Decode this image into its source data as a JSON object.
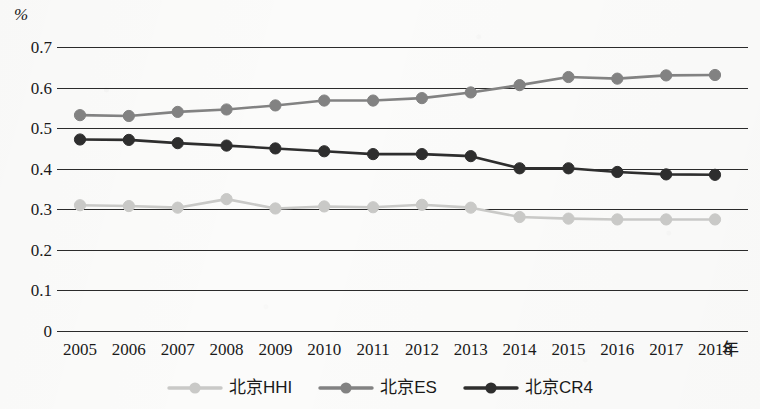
{
  "chart_data": {
    "type": "line",
    "title": "",
    "subtitle": "",
    "xlabel": "年",
    "ylabel": "%",
    "unit_label": "%",
    "x": [
      2005,
      2006,
      2007,
      2008,
      2009,
      2010,
      2011,
      2012,
      2013,
      2014,
      2015,
      2016,
      2017,
      2018
    ],
    "categories": [
      "2005",
      "2006",
      "2007",
      "2008",
      "2009",
      "2010",
      "2011",
      "2012",
      "2013",
      "2014",
      "2015",
      "2016",
      "2017",
      "2018"
    ],
    "ylim": [
      0,
      0.7
    ],
    "yticks": [
      0,
      0.1,
      0.2,
      0.3,
      0.4,
      0.5,
      0.6,
      0.7
    ],
    "ytick_labels": [
      "0",
      "0.1",
      "0.2",
      "0.3",
      "0.4",
      "0.5",
      "0.6",
      "0.7"
    ],
    "grid": true,
    "grid_axis": "y",
    "legend_position": "bottom",
    "marker": "circle",
    "series": [
      {
        "name": "北京HHI",
        "color": "#c9c9c7",
        "values": [
          0.31,
          0.308,
          0.304,
          0.325,
          0.302,
          0.307,
          0.305,
          0.311,
          0.304,
          0.281,
          0.277,
          0.275,
          0.275,
          0.275
        ]
      },
      {
        "name": "北京ES",
        "color": "#828282",
        "values": [
          0.532,
          0.53,
          0.54,
          0.546,
          0.556,
          0.568,
          0.568,
          0.574,
          0.588,
          0.606,
          0.626,
          0.622,
          0.63,
          0.631
        ]
      },
      {
        "name": "北京CR4",
        "color": "#2e2e2e",
        "values": [
          0.472,
          0.471,
          0.463,
          0.457,
          0.45,
          0.443,
          0.436,
          0.436,
          0.431,
          0.401,
          0.401,
          0.392,
          0.386,
          0.385
        ]
      }
    ]
  },
  "axes": {
    "unit_label": "%",
    "x_unit_label": "年"
  },
  "legend": {
    "items": [
      {
        "label": "北京HHI",
        "color": "#c9c9c7"
      },
      {
        "label": "北京ES",
        "color": "#828282"
      },
      {
        "label": "北京CR4",
        "color": "#2e2e2e"
      }
    ]
  }
}
